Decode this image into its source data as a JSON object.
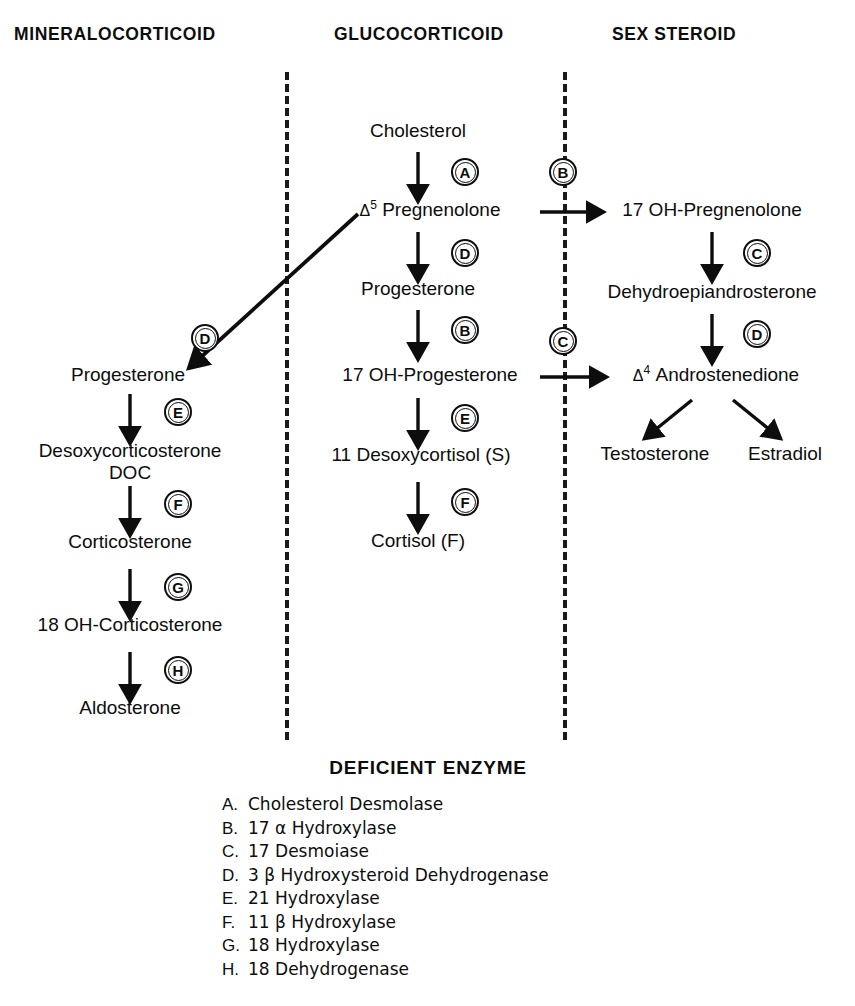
{
  "columns": [
    {
      "id": "mineralocorticoid",
      "label": "MINERALOCORTICOID"
    },
    {
      "id": "glucocorticoid",
      "label": "GLUCOCORTICOID"
    },
    {
      "id": "sex-steroid",
      "label": "SEX STEROID"
    }
  ],
  "nodes": {
    "cholesterol": "Cholesterol",
    "pregnenolone_pre": "Δ",
    "pregnenolone_sup": "5",
    "pregnenolone_name": " Pregnenolone",
    "progesterone_center": "Progesterone",
    "oh_progesterone": "17 OH-Progesterone",
    "desoxycortisol": "11 Desoxycortisol (S)",
    "cortisol": "Cortisol (F)",
    "progesterone_left": "Progesterone",
    "doc_line1": "Desoxycorticosterone",
    "doc_line2": "DOC",
    "corticosterone": "Corticosterone",
    "oh_corticosterone": "18 OH-Corticosterone",
    "aldosterone": "Aldosterone",
    "oh_pregnenolone": "17 OH-Pregnenolone",
    "dhea": "Dehydroepiandrosterone",
    "androstenedione_pre": "Δ",
    "androstenedione_sup": "4",
    "androstenedione_name": " Androstenedione",
    "testosterone": "Testosterone",
    "estradiol": "Estradiol"
  },
  "enzyme_markers": {
    "a_cholesterol_to_pregnenolone": "A",
    "b_pregnenolone_to_17oh_pregnenolone": "B",
    "d_pregnenolone_to_progesterone_center": "D",
    "b_progesterone_to_17oh_progesterone": "B",
    "e_17oh_progesterone_to_desoxycortisol": "E",
    "f_desoxycortisol_to_cortisol": "F",
    "c_17oh_pregnenolone_to_dhea": "C",
    "d_dhea_to_androstenedione": "D",
    "c_17oh_progesterone_to_androstenedione": "C",
    "d_pregnenolone_to_progesterone_left": "D",
    "e_progesterone_to_doc": "E",
    "f_doc_to_corticosterone": "F",
    "g_corticosterone_to_18oh": "G",
    "h_18oh_to_aldosterone": "H"
  },
  "legend": {
    "title": "DEFICIENT ENZYME",
    "items": [
      {
        "key": "A.",
        "text": "Cholesterol Desmolase"
      },
      {
        "key": "B.",
        "text": "17 α Hydroxylase"
      },
      {
        "key": "C.",
        "text": "17 Desmoiase"
      },
      {
        "key": "D.",
        "text": "3 β Hydroxysteroid Dehydrogenase"
      },
      {
        "key": "E.",
        "text": "21 Hydroxylase"
      },
      {
        "key": "F.",
        "text": "11 β Hydroxylase"
      },
      {
        "key": "G.",
        "text": "18 Hydroxylase"
      },
      {
        "key": "H.",
        "text": "18 Dehydrogenase"
      }
    ]
  },
  "colors": {
    "ink": "#0d0d0d",
    "background": "#ffffff"
  }
}
